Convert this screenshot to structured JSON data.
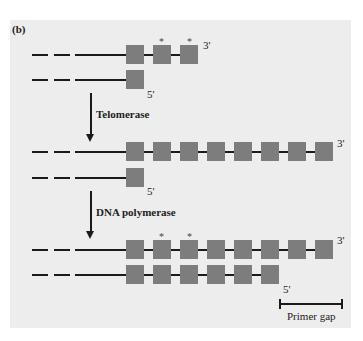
{
  "panel_label": "(b)",
  "colors": {
    "background": "#ededed",
    "repeat_box": "#7d7d7d",
    "line": "#1a1a1a"
  },
  "stages": [
    {
      "name": "initial",
      "top_strand": {
        "repeats": 3,
        "end_label": "3'",
        "starred_repeats": [
          2,
          3
        ]
      },
      "bottom_strand": {
        "repeats": 1,
        "end_label": "5'"
      }
    },
    {
      "name": "after-telomerase",
      "top_strand": {
        "repeats": 8,
        "end_label": "3'"
      },
      "bottom_strand": {
        "repeats": 1,
        "end_label": "5'"
      }
    },
    {
      "name": "after-dna-polymerase",
      "top_strand": {
        "repeats": 8,
        "end_label": "3'",
        "starred_repeats": [
          2,
          3
        ]
      },
      "bottom_strand": {
        "repeats": 6,
        "end_label": "5'"
      }
    }
  ],
  "arrows": [
    {
      "label": "Telomerase"
    },
    {
      "label": "DNA polymerase"
    }
  ],
  "labels": {
    "s1_top_end": "3'",
    "s1_bot_end": "5'",
    "s2_top_end": "3'",
    "s2_bot_end": "5'",
    "s3_top_end": "3'",
    "s3_bot_end": "5'",
    "star": "*",
    "arrow1": "Telomerase",
    "arrow2": "DNA polymerase",
    "primer_gap": "Primer gap"
  }
}
